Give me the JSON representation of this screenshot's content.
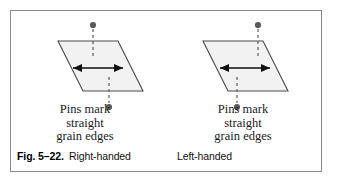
{
  "figure": {
    "number": "Fig. 5–22.",
    "border_color": "#8a8a8a",
    "page_background": "#ffffff"
  },
  "panels": [
    {
      "id": "right-handed",
      "handedness_label": "Right-handed",
      "annotation": "Pins mark\nstraight\ngrain edges",
      "shape": {
        "name": "parallelogram",
        "fill": "#f2f2f2",
        "stroke": "#4a4a4a",
        "points": "47,30 107,30 132,80 72,80"
      },
      "arrow": {
        "name": "double-headed-horizontal-arrow",
        "color": "#111111",
        "x1": 62,
        "x2": 112,
        "y": 57
      },
      "pins": [
        {
          "name": "top-pin",
          "head_x": 82,
          "head_y": 14,
          "line_from_y": 18,
          "line_to_y": 46,
          "color": "#5a5a5a"
        },
        {
          "name": "bottom-pin",
          "head_x": 98,
          "head_y": 96,
          "line_from_y": 66,
          "line_to_y": 92,
          "color": "#5a5a5a"
        }
      ]
    },
    {
      "id": "left-handed",
      "handedness_label": "Left-handed",
      "annotation": "Pins mark\nstraight\ngrain edges",
      "shape": {
        "name": "parallelogram",
        "fill": "#f2f2f2",
        "stroke": "#4a4a4a",
        "points": "36,30 96,30 121,80 61,80"
      },
      "arrow": {
        "name": "double-headed-horizontal-arrow",
        "color": "#111111",
        "x1": 53,
        "x2": 103,
        "y": 57
      },
      "pins": [
        {
          "name": "top-pin",
          "head_x": 91,
          "head_y": 14,
          "line_from_y": 18,
          "line_to_y": 46,
          "color": "#5a5a5a"
        },
        {
          "name": "bottom-pin",
          "head_x": 70,
          "head_y": 96,
          "line_from_y": 66,
          "line_to_y": 92,
          "color": "#5a5a5a"
        }
      ]
    }
  ]
}
